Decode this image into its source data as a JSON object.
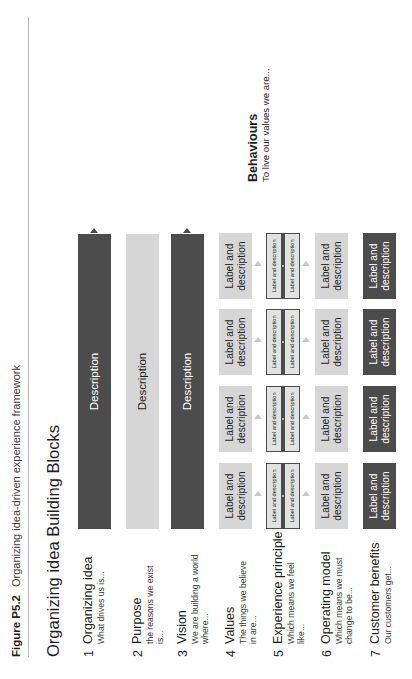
{
  "caption": {
    "number": "Figure P5.2",
    "text": "Organizing idea-driven experience framework"
  },
  "figure_title": "Organizing idea Building Blocks",
  "callout": {
    "title": "Behaviours",
    "subtitle": "To live our values we are..."
  },
  "labels": {
    "label_and_description": "Label and description",
    "description": "Description"
  },
  "rows": [
    {
      "num": "1",
      "name": "Organizing idea",
      "sub": "What drives us is...",
      "style": "dark",
      "kind": "single",
      "cell": "Description"
    },
    {
      "num": "2",
      "name": "Purpose",
      "sub": "the reasons we exist is...",
      "style": "light",
      "kind": "single",
      "cell": "Description"
    },
    {
      "num": "3",
      "name": "Vision",
      "sub": "We are building a world where...",
      "style": "dark",
      "kind": "single",
      "cell": "Description"
    },
    {
      "num": "4",
      "name": "Values",
      "sub": "The things we believe in are...",
      "style": "light",
      "kind": "quad",
      "cells": [
        "Label and description",
        "Label and description",
        "Label and description",
        "Label and description"
      ]
    },
    {
      "num": "5",
      "name": "Experience principle",
      "sub": "Which means we feel like...",
      "style": "boxed",
      "kind": "quad-paired",
      "cells": [
        {
          "top": "Label and description",
          "bottom": "Label and description"
        },
        {
          "top": "Label and description",
          "bottom": "Label and description"
        },
        {
          "top": "Label and description",
          "bottom": "Label and description"
        },
        {
          "top": "Label and description",
          "bottom": "Label and description"
        }
      ]
    },
    {
      "num": "6",
      "name": "Operating model",
      "sub": "Which means we must change to be...",
      "style": "light",
      "kind": "quad",
      "cells": [
        "Label and description",
        "Label and description",
        "Label and description",
        "Label and description"
      ]
    },
    {
      "num": "7",
      "name": "Customer benefits",
      "sub": "Our customers get...",
      "style": "dark",
      "kind": "quad",
      "cells": [
        "Label and description",
        "Label and description",
        "Label and description",
        "Label and description"
      ]
    }
  ],
  "colors": {
    "dark": "#4c4c4c",
    "light": "#d6d6d6",
    "boxed_border": "#4c4c4c",
    "rule": "#b9b9b9"
  }
}
